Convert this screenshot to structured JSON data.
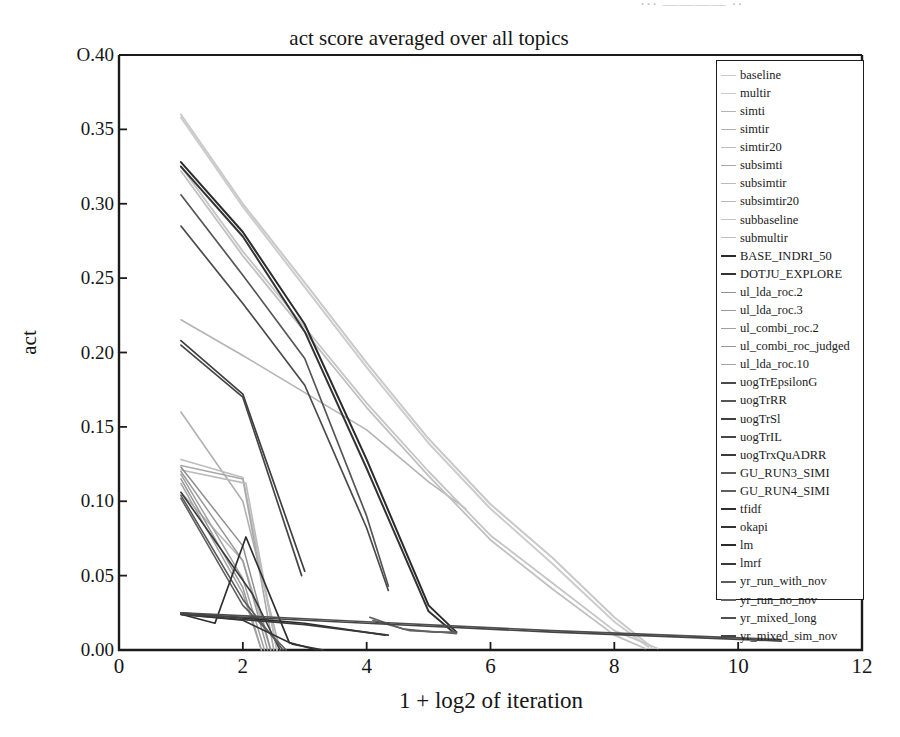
{
  "figure": {
    "width": 900,
    "height": 737,
    "background": "#ffffff",
    "scan_artifact_text": "··· ———— ··"
  },
  "chart_data": {
    "type": "line",
    "title": "act score averaged over all topics",
    "xlabel": "1 + log2 of iteration",
    "ylabel": "act",
    "xlim": [
      0,
      12
    ],
    "ylim": [
      0.0,
      0.4
    ],
    "grid": false,
    "legend_position": "right-inside",
    "xticks": [
      "0",
      "2",
      "4",
      "6",
      "8",
      "10",
      "12"
    ],
    "xtick_values": [
      0,
      2,
      4,
      6,
      8,
      10,
      12
    ],
    "yticks": [
      "0.00",
      "0.05",
      "0.10",
      "0.15",
      "0.20",
      "0.25",
      "0.30",
      "0.35",
      "O.40"
    ],
    "ytick_values": [
      0.0,
      0.05,
      0.1,
      0.15,
      0.2,
      0.25,
      0.3,
      0.35,
      0.4
    ],
    "series": [
      {
        "name": "baseline",
        "color": "#c9c9c9",
        "width": 2.0,
        "x": [
          1.0,
          2.0,
          3.0,
          4.0,
          5.0,
          6.0,
          7.0,
          8.0,
          8.6
        ],
        "y": [
          0.36,
          0.3,
          0.247,
          0.193,
          0.142,
          0.098,
          0.062,
          0.022,
          0.002
        ]
      },
      {
        "name": "multir",
        "color": "#cccccc",
        "width": 2.0,
        "x": [
          1.0,
          2.0,
          3.0,
          4.0,
          5.0,
          6.0,
          7.0,
          8.0,
          8.55
        ],
        "y": [
          0.358,
          0.298,
          0.244,
          0.19,
          0.139,
          0.095,
          0.058,
          0.019,
          0.002
        ]
      },
      {
        "name": "simti",
        "color": "#b4b4b4",
        "width": 1.6,
        "x": [
          1.0,
          2.0,
          3.0,
          4.0,
          5.0,
          5.6
        ],
        "y": [
          0.222,
          0.198,
          0.173,
          0.148,
          0.113,
          0.095
        ]
      },
      {
        "name": "simtir",
        "color": "#b0b0b0",
        "width": 1.6,
        "x": [
          1.0,
          2.0,
          2.6
        ],
        "y": [
          0.16,
          0.1,
          0.0
        ]
      },
      {
        "name": "simtir20",
        "color": "#bdbdbd",
        "width": 1.6,
        "x": [
          1.0,
          2.0,
          2.55
        ],
        "y": [
          0.128,
          0.116,
          0.0
        ]
      },
      {
        "name": "subsimti",
        "color": "#a9a9a9",
        "width": 1.6,
        "x": [
          1.0,
          2.0,
          2.5
        ],
        "y": [
          0.124,
          0.115,
          0.0
        ]
      },
      {
        "name": "subsimtir",
        "color": "#bbbbbb",
        "width": 1.6,
        "x": [
          1.0,
          2.05,
          2.55
        ],
        "y": [
          0.121,
          0.112,
          0.0
        ]
      },
      {
        "name": "subsimtir20",
        "color": "#b7b7b7",
        "width": 1.6,
        "x": [
          1.0,
          2.0,
          2.45
        ],
        "y": [
          0.106,
          0.06,
          0.0
        ]
      },
      {
        "name": "subbaseline",
        "color": "#c5c5c5",
        "width": 1.8,
        "x": [
          1.0,
          2.0,
          3.0,
          4.0,
          5.0,
          6.0,
          7.0,
          8.0,
          8.7
        ],
        "y": [
          0.325,
          0.268,
          0.217,
          0.166,
          0.12,
          0.077,
          0.045,
          0.013,
          0.001
        ]
      },
      {
        "name": "submultir",
        "color": "#c0c0c0",
        "width": 1.8,
        "x": [
          1.0,
          2.0,
          3.0,
          4.0,
          5.0,
          6.0,
          7.0,
          8.0,
          8.5
        ],
        "y": [
          0.322,
          0.265,
          0.214,
          0.163,
          0.117,
          0.074,
          0.041,
          0.01,
          0.001
        ]
      },
      {
        "name": "BASE_INDRI_50",
        "color": "#2b2b2b",
        "width": 2.0,
        "x": [
          1.0,
          2.0,
          3.0,
          4.0,
          5.0,
          5.45
        ],
        "y": [
          0.328,
          0.281,
          0.219,
          0.128,
          0.03,
          0.012
        ]
      },
      {
        "name": "DOTJU_EXPLORE",
        "color": "#333333",
        "width": 2.0,
        "x": [
          1.0,
          2.0,
          3.0,
          4.0,
          5.0,
          5.4
        ],
        "y": [
          0.325,
          0.278,
          0.214,
          0.122,
          0.026,
          0.012
        ]
      },
      {
        "name": "ul_lda_roc.2",
        "color": "#8f8f8f",
        "width": 1.5,
        "x": [
          1.0,
          2.0,
          2.45
        ],
        "y": [
          0.123,
          0.07,
          0.0
        ]
      },
      {
        "name": "ul_lda_roc.3",
        "color": "#9a9a9a",
        "width": 1.5,
        "x": [
          1.0,
          2.0,
          2.4
        ],
        "y": [
          0.12,
          0.06,
          0.0
        ]
      },
      {
        "name": "ul_combi_roc.2",
        "color": "#a0a0a0",
        "width": 1.5,
        "x": [
          1.0,
          2.0,
          2.35
        ],
        "y": [
          0.118,
          0.048,
          0.0
        ]
      },
      {
        "name": "ul_combi_roc_judged",
        "color": "#979797",
        "width": 1.5,
        "x": [
          1.0,
          2.0,
          2.3
        ],
        "y": [
          0.115,
          0.042,
          0.0
        ]
      },
      {
        "name": "ul_lda_roc.10",
        "color": "#a4a4a4",
        "width": 1.5,
        "x": [
          1.0,
          2.0,
          2.3
        ],
        "y": [
          0.112,
          0.038,
          0.0
        ]
      },
      {
        "name": "uogTrEpsilonG",
        "color": "#4a4a4a",
        "width": 1.7,
        "x": [
          1.0,
          2.0,
          3.0,
          4.0,
          4.35
        ],
        "y": [
          0.285,
          0.233,
          0.178,
          0.082,
          0.04
        ]
      },
      {
        "name": "uogTrRR",
        "color": "#555555",
        "width": 1.7,
        "x": [
          1.0,
          2.0,
          3.0,
          4.0,
          4.35
        ],
        "y": [
          0.306,
          0.252,
          0.196,
          0.09,
          0.043
        ]
      },
      {
        "name": "uogTrSl",
        "color": "#3f3f3f",
        "width": 1.7,
        "x": [
          1.0,
          2.0,
          3.0
        ],
        "y": [
          0.208,
          0.172,
          0.053
        ]
      },
      {
        "name": "uogTrIL",
        "color": "#464646",
        "width": 1.7,
        "x": [
          1.0,
          2.0,
          2.95
        ],
        "y": [
          0.205,
          0.17,
          0.05
        ]
      },
      {
        "name": "uogTrxQuADRR",
        "color": "#3a3a3a",
        "width": 1.6,
        "x": [
          1.0,
          2.15,
          2.6
        ],
        "y": [
          0.106,
          0.038,
          0.0
        ]
      },
      {
        "name": "GU_RUN3_SIMI",
        "color": "#5a5a5a",
        "width": 1.6,
        "x": [
          1.0,
          2.0,
          2.65
        ],
        "y": [
          0.104,
          0.034,
          0.0
        ]
      },
      {
        "name": "GU_RUN4_SIMI",
        "color": "#5f5f5f",
        "width": 1.6,
        "x": [
          1.0,
          2.0,
          2.7
        ],
        "y": [
          0.102,
          0.03,
          0.0
        ]
      },
      {
        "name": "tfidf",
        "color": "#2e2e2e",
        "width": 1.7,
        "x": [
          1.0,
          1.55,
          2.05,
          2.75,
          3.2
        ],
        "y": [
          0.024,
          0.018,
          0.076,
          0.005,
          0.0
        ]
      },
      {
        "name": "okapi",
        "color": "#343434",
        "width": 1.7,
        "x": [
          1.0,
          2.0,
          2.8,
          3.3
        ],
        "y": [
          0.024,
          0.02,
          0.004,
          0.0
        ]
      },
      {
        "name": "lm",
        "color": "#2a2a2a",
        "width": 1.7,
        "x": [
          1.0,
          3.0,
          4.3
        ],
        "y": [
          0.025,
          0.018,
          0.01
        ]
      },
      {
        "name": "lmrf",
        "color": "#383838",
        "width": 1.7,
        "x": [
          1.0,
          3.0,
          4.35
        ],
        "y": [
          0.024,
          0.017,
          0.01
        ]
      },
      {
        "name": "yr_run_with_nov",
        "color": "#5c5c5c",
        "width": 1.6,
        "x": [
          4.05,
          4.6,
          5.1,
          5.45
        ],
        "y": [
          0.022,
          0.014,
          0.012,
          0.012
        ]
      },
      {
        "name": "yr_run_no_nov",
        "color": "#636363",
        "width": 1.6,
        "x": [
          4.1,
          4.7,
          5.2,
          5.45
        ],
        "y": [
          0.02,
          0.013,
          0.012,
          0.011
        ]
      },
      {
        "name": "yr_mixed_long",
        "color": "#4f4f4f",
        "width": 1.6,
        "x": [
          1.0,
          4.0,
          7.0,
          9.5,
          10.7
        ],
        "y": [
          0.025,
          0.019,
          0.013,
          0.009,
          0.007
        ]
      },
      {
        "name": "yr_mixed_sim_nov",
        "color": "#454545",
        "width": 1.6,
        "x": [
          1.0,
          4.0,
          7.0,
          9.5,
          10.7
        ],
        "y": [
          0.024,
          0.018,
          0.012,
          0.008,
          0.006
        ]
      }
    ],
    "legend_entries": [
      {
        "label": "baseline",
        "color": "#c9c9c9",
        "width": 1.6
      },
      {
        "label": "multir",
        "color": "#cccccc",
        "width": 1.6
      },
      {
        "label": "simti",
        "color": "#b4b4b4",
        "width": 1.6
      },
      {
        "label": "simtir",
        "color": "#b0b0b0",
        "width": 1.6
      },
      {
        "label": "simtir20",
        "color": "#bdbdbd",
        "width": 1.6
      },
      {
        "label": "subsimti",
        "color": "#a9a9a9",
        "width": 1.6
      },
      {
        "label": "subsimtir",
        "color": "#bbbbbb",
        "width": 1.6
      },
      {
        "label": "subsimtir20",
        "color": "#b7b7b7",
        "width": 1.6
      },
      {
        "label": "subbaseline",
        "color": "#c5c5c5",
        "width": 1.6
      },
      {
        "label": "submultir",
        "color": "#c0c0c0",
        "width": 1.6
      },
      {
        "label": "BASE_INDRI_50",
        "color": "#2b2b2b",
        "width": 2.6
      },
      {
        "label": "DOTJU_EXPLORE",
        "color": "#333333",
        "width": 2.6
      },
      {
        "label": "ul_lda_roc.2",
        "color": "#8f8f8f",
        "width": 1.6
      },
      {
        "label": "ul_lda_roc.3",
        "color": "#9a9a9a",
        "width": 1.6
      },
      {
        "label": "ul_combi_roc.2",
        "color": "#a0a0a0",
        "width": 1.6
      },
      {
        "label": "ul_combi_roc_judged",
        "color": "#979797",
        "width": 1.6
      },
      {
        "label": "ul_lda_roc.10",
        "color": "#a4a4a4",
        "width": 1.6
      },
      {
        "label": "uogTrEpsilonG",
        "color": "#4a4a4a",
        "width": 2.2
      },
      {
        "label": "uogTrRR",
        "color": "#555555",
        "width": 2.2
      },
      {
        "label": "uogTrSl",
        "color": "#3f3f3f",
        "width": 2.2
      },
      {
        "label": "uogTrIL",
        "color": "#464646",
        "width": 2.2
      },
      {
        "label": "uogTrxQuADRR",
        "color": "#3a3a3a",
        "width": 2.2
      },
      {
        "label": "GU_RUN3_SIMI",
        "color": "#5a5a5a",
        "width": 2.2
      },
      {
        "label": "GU_RUN4_SIMI",
        "color": "#5f5f5f",
        "width": 2.2
      },
      {
        "label": "tfidf",
        "color": "#2e2e2e",
        "width": 2.4
      },
      {
        "label": "okapi",
        "color": "#343434",
        "width": 2.4
      },
      {
        "label": "lm",
        "color": "#2a2a2a",
        "width": 2.4
      },
      {
        "label": "lmrf",
        "color": "#383838",
        "width": 2.4
      },
      {
        "label": "yr_run_with_nov",
        "color": "#5c5c5c",
        "width": 2.2
      },
      {
        "label": "yr_run_no_nov",
        "color": "#636363",
        "width": 2.2
      },
      {
        "label": "yr_mixed_long",
        "color": "#4f4f4f",
        "width": 2.2
      },
      {
        "label": "yr_mixed_sim_nov",
        "color": "#454545",
        "width": 2.2
      }
    ]
  }
}
